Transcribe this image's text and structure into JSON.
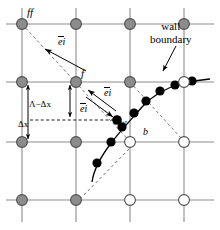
{
  "figure": {
    "width": 220,
    "height": 230,
    "background": "#ffffff"
  },
  "colors": {
    "fluid_node_fill": "#8c8c8c",
    "solid_node_fill": "#ffffff",
    "node_stroke": "#4d4d4d",
    "grid_line": "#8c8c8c",
    "wall_curve": "#000000",
    "boundary_point": "#000000",
    "dashed_line": "#7a7a7a",
    "text": "#000000"
  },
  "labels": {
    "far_fluid_node": "ff",
    "fluid_node": "f",
    "wall_point": "w",
    "boundary_node": "b",
    "wall_boundary_line1": "wall",
    "wall_boundary_line2": "boundary",
    "dimension_upper": "Λ−Δx",
    "dimension_lower": "Δx",
    "direction_vector": "e",
    "direction_subscript": "i"
  },
  "grid": {
    "columns_x": [
      22,
      76,
      130,
      184
    ],
    "rows_y": [
      24,
      82,
      142,
      200
    ],
    "spacing_x": 54,
    "spacing_y": 58,
    "nodes": [
      {
        "x": 22,
        "y": 24,
        "type": "fluid"
      },
      {
        "x": 76,
        "y": 24,
        "type": "fluid"
      },
      {
        "x": 130,
        "y": 24,
        "type": "fluid"
      },
      {
        "x": 184,
        "y": 24,
        "type": "fluid"
      },
      {
        "x": 22,
        "y": 82,
        "type": "fluid"
      },
      {
        "x": 76,
        "y": 82,
        "type": "fluid"
      },
      {
        "x": 130,
        "y": 82,
        "type": "fluid"
      },
      {
        "x": 184,
        "y": 82,
        "type": "solid"
      },
      {
        "x": 22,
        "y": 142,
        "type": "fluid"
      },
      {
        "x": 76,
        "y": 142,
        "type": "fluid"
      },
      {
        "x": 130,
        "y": 142,
        "type": "solid"
      },
      {
        "x": 184,
        "y": 142,
        "type": "solid"
      },
      {
        "x": 22,
        "y": 200,
        "type": "fluid"
      },
      {
        "x": 76,
        "y": 200,
        "type": "fluid"
      },
      {
        "x": 130,
        "y": 200,
        "type": "solid"
      },
      {
        "x": 184,
        "y": 200,
        "type": "solid"
      }
    ]
  },
  "wall_curve": {
    "description": "solid curved wall boundary passing through w",
    "path": "M 92,182 C 94,168 101,156 112,142 C 121,130 131,120 142,107 C 152,96 164,88 178,84 C 190,81 199,80 208,80",
    "marker_points": [
      {
        "x": 97,
        "y": 163
      },
      {
        "x": 111,
        "y": 142
      },
      {
        "x": 122,
        "y": 127
      },
      {
        "x": 133,
        "y": 113
      },
      {
        "x": 145,
        "y": 101
      },
      {
        "x": 158,
        "y": 91
      },
      {
        "x": 172,
        "y": 85
      },
      {
        "x": 188,
        "y": 82
      },
      {
        "x": 204,
        "y": 80
      }
    ],
    "wall_point_w": {
      "x": 117,
      "y": 120
    }
  },
  "vectors": [
    {
      "name": "e_i_upper_left",
      "from": {
        "x": 88,
        "y": 70
      },
      "to": {
        "x": 44,
        "y": 48
      }
    },
    {
      "name": "e_i_mid_upleft",
      "from": {
        "x": 117,
        "y": 112
      },
      "to": {
        "x": 86,
        "y": 90
      }
    },
    {
      "name": "e_i_mid_downright",
      "from": {
        "x": 86,
        "y": 96
      },
      "to": {
        "x": 115,
        "y": 118
      }
    }
  ],
  "dashed_lines": [
    {
      "name": "ff-to-w-link",
      "from": {
        "x": 22,
        "y": 24
      },
      "to": {
        "x": 130,
        "y": 142
      }
    },
    {
      "name": "w-to-lower-left",
      "from": {
        "x": 117,
        "y": 120
      },
      "to": {
        "x": 76,
        "y": 142
      }
    },
    {
      "name": "upper-right-diagonal",
      "from": {
        "x": 130,
        "y": 82
      },
      "to": {
        "x": 184,
        "y": 142
      }
    },
    {
      "name": "lower-left-diagonal",
      "from": {
        "x": 76,
        "y": 200
      },
      "to": {
        "x": 130,
        "y": 142
      }
    },
    {
      "name": "dx-horizontal",
      "from": {
        "x": 28,
        "y": 120
      },
      "to": {
        "x": 117,
        "y": 120
      }
    }
  ],
  "dimension_arrows": [
    {
      "name": "total-height-arrow",
      "x": 28,
      "from_y": 82,
      "to_y": 142
    },
    {
      "name": "upper-gap-arrow",
      "x": 70,
      "from_y": 82,
      "to_y": 120
    }
  ],
  "annotation": {
    "leader_from": {
      "x": 175,
      "y": 47
    },
    "leader_to": {
      "x": 162,
      "y": 70
    }
  }
}
